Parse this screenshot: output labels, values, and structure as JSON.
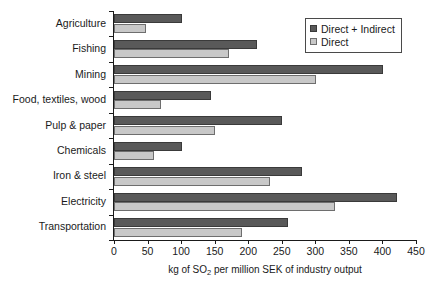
{
  "chart_data": {
    "type": "bar",
    "orientation": "horizontal",
    "title": "",
    "xlabel": "kg of SO2 per million SEK of industry output",
    "xlabel_parts": {
      "before": "kg of SO",
      "sub": "2",
      "after": " per million SEK of industry output"
    },
    "ylabel": "",
    "xlim": [
      0,
      450
    ],
    "xticks": [
      0,
      50,
      100,
      150,
      200,
      250,
      300,
      350,
      400,
      450
    ],
    "xtick_labels": [
      "0",
      "50",
      "100",
      "150",
      "200",
      "250",
      "300",
      "350",
      "400",
      "450"
    ],
    "grid": false,
    "legend_position": "top-right",
    "categories": [
      "Agriculture",
      "Fishing",
      "Mining",
      "Food, textiles, wood",
      "Pulp & paper",
      "Chemicals",
      "Iron & steel",
      "Electricity",
      "Transportation"
    ],
    "series": [
      {
        "name": "Direct + Indirect",
        "color": "#595959",
        "values": [
          101,
          213,
          401,
          145,
          250,
          101,
          280,
          421,
          259
        ]
      },
      {
        "name": "Direct",
        "color": "#c8c8c8",
        "values": [
          48,
          171,
          301,
          70,
          151,
          60,
          233,
          330,
          190
        ]
      }
    ]
  },
  "legend": {
    "entries": [
      {
        "label": "Direct + Indirect"
      },
      {
        "label": "Direct"
      }
    ]
  }
}
